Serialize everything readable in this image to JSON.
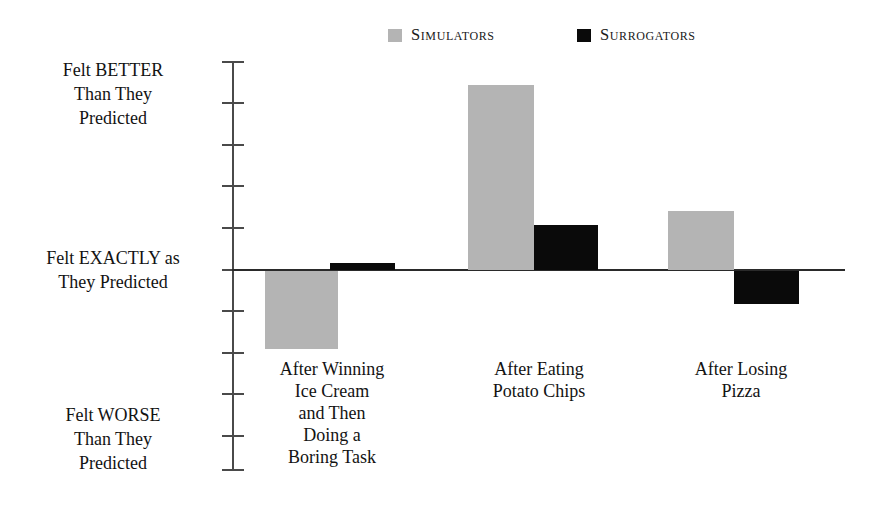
{
  "legend": {
    "items": [
      {
        "label": "Simulators",
        "color": "#b4b4b4",
        "swatch": "gray-square-icon"
      },
      {
        "label": "Surrogators",
        "color": "#0a0a0a",
        "swatch": "black-square-icon"
      }
    ]
  },
  "axis": {
    "top_label": "Felt BETTER\nThan They\nPredicted",
    "top_label_lines": [
      "Felt BETTER",
      "Than They",
      "Predicted"
    ],
    "middle_label_lines": [
      "Felt EXACTLY as",
      "They Predicted"
    ],
    "bottom_label_lines": [
      "Felt WORSE",
      "Than They",
      "Predicted"
    ]
  },
  "chart_data": {
    "type": "bar",
    "title": "",
    "subtitle": "",
    "xlabel": "",
    "ylabel": "Felt BETTER / EXACTLY as / WORSE Than They Predicted",
    "orientation": "vertical",
    "grouped": true,
    "grid": false,
    "legend_position": "top-center",
    "zero_reference": 0,
    "ylim": [
      -5,
      5
    ],
    "ytick_values": [
      5,
      4,
      3,
      2,
      1,
      0,
      -1,
      -2,
      -3,
      -4
    ],
    "ytick_labels": [
      "",
      "",
      "",
      "",
      "",
      "",
      "",
      "",
      "",
      ""
    ],
    "ytick_named": {
      "positive_extreme": "Felt BETTER Than They Predicted",
      "zero": "Felt EXACTLY as They Predicted",
      "negative_extreme": "Felt WORSE Than They Predicted"
    },
    "categories": [
      "After Winning Ice Cream and Then Doing a Boring Task",
      "After Eating Potato Chips",
      "After Losing Pizza"
    ],
    "category_label_lines": [
      [
        "After Winning",
        "Ice Cream",
        "and Then",
        "Doing a",
        "Boring Task"
      ],
      [
        "After Eating",
        "Potato Chips"
      ],
      [
        "After Losing",
        "Pizza"
      ]
    ],
    "series": [
      {
        "name": "Simulators",
        "color": "#b4b4b4",
        "values": [
          -1.9,
          4.5,
          1.4
        ]
      },
      {
        "name": "Surrogators",
        "color": "#0a0a0a",
        "values": [
          0.15,
          1.1,
          -0.8
        ]
      }
    ]
  },
  "geometry": {
    "zero_y": 270,
    "unit_px": 41.3,
    "axis_x": 232,
    "axis_top_y": 62,
    "axis_bottom_y": 471,
    "zero_line_right_x": 845,
    "bars": [
      {
        "name": "bar-sim-0",
        "series": "Simulators",
        "group": 0,
        "left": 265,
        "width": 73,
        "top": 271,
        "height": 78
      },
      {
        "name": "bar-sur-0",
        "series": "Surrogators",
        "group": 0,
        "left": 330,
        "width": 65,
        "top": 263,
        "height": 7
      },
      {
        "name": "bar-sim-1",
        "series": "Simulators",
        "group": 1,
        "left": 468,
        "width": 66,
        "top": 85,
        "height": 185
      },
      {
        "name": "bar-sur-1",
        "series": "Surrogators",
        "group": 1,
        "left": 534,
        "width": 64,
        "top": 225,
        "height": 45
      },
      {
        "name": "bar-sim-2",
        "series": "Simulators",
        "group": 2,
        "left": 668,
        "width": 66,
        "top": 211,
        "height": 59
      },
      {
        "name": "bar-sur-2",
        "series": "Surrogators",
        "group": 2,
        "left": 734,
        "width": 65,
        "top": 271,
        "height": 33
      }
    ],
    "ticks_y": [
      62,
      103,
      145,
      186,
      228,
      270,
      311,
      353,
      394,
      436,
      470
    ]
  }
}
